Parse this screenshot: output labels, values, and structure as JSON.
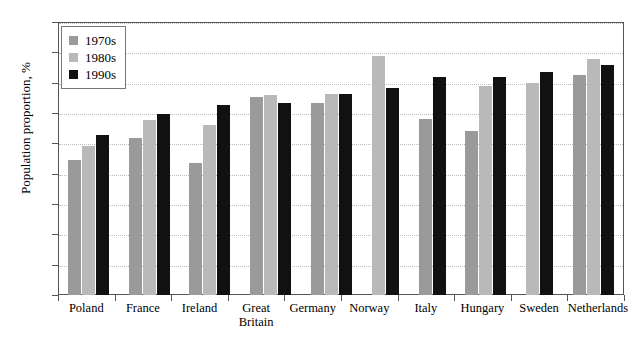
{
  "chart_data": {
    "type": "bar",
    "title": "",
    "xlabel": "",
    "ylabel": "Population proportion, %",
    "ylim": [
      0,
      45
    ],
    "yticks": [
      0,
      5,
      10,
      15,
      20,
      25,
      30,
      35,
      40,
      45
    ],
    "grid": true,
    "legend_position": "top-left",
    "categories": [
      "Poland",
      "France",
      "Ireland",
      "Great\nBritain",
      "Germany",
      "Norway",
      "Italy",
      "Hungary",
      "Sweden",
      "Netherlands"
    ],
    "category_lines": [
      [
        "Poland"
      ],
      [
        "France"
      ],
      [
        "Ireland"
      ],
      [
        "Great",
        "Britain"
      ],
      [
        "Germany"
      ],
      [
        "Norway"
      ],
      [
        "Italy"
      ],
      [
        "Hungary"
      ],
      [
        "Sweden"
      ],
      [
        "Netherlands"
      ]
    ],
    "series": [
      {
        "name": "1970s",
        "color": "#9a9a9a",
        "values": [
          22.2,
          25.8,
          21.7,
          32.7,
          31.6,
          null,
          29.0,
          27.0,
          null,
          36.3
        ]
      },
      {
        "name": "1980s",
        "color": "#b9b9b9",
        "values": [
          24.5,
          28.8,
          28.0,
          33.0,
          33.2,
          39.4,
          null,
          34.4,
          35.0,
          38.9
        ]
      },
      {
        "name": "1990s",
        "color": "#111111",
        "values": [
          26.3,
          29.8,
          31.4,
          31.6,
          33.2,
          34.1,
          36.0,
          36.0,
          36.7,
          37.9
        ]
      }
    ]
  },
  "legend": {
    "items": [
      {
        "label": "1970s",
        "series_class": "s1970"
      },
      {
        "label": "1980s",
        "series_class": "s1980"
      },
      {
        "label": "1990s",
        "series_class": "s1990"
      }
    ]
  },
  "axis": {
    "y_title": "Population proportion, %"
  }
}
